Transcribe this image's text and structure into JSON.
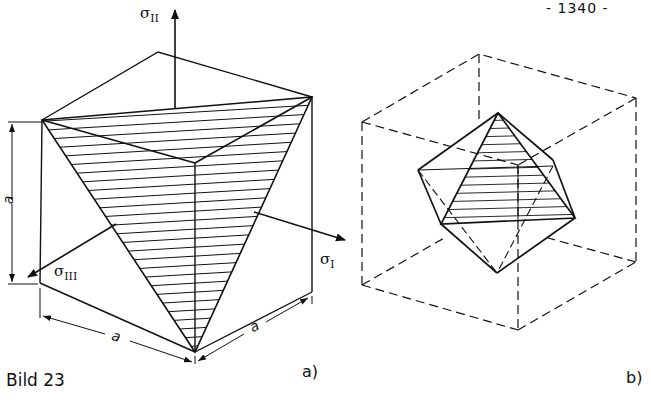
{
  "page_number": "- 1340 -",
  "caption": "Bild 23",
  "figure_a": {
    "label": "a)",
    "axes": {
      "sigma_1": {
        "symbol": "σ",
        "sub": "I"
      },
      "sigma_2": {
        "symbol": "σ",
        "sub": "II"
      },
      "sigma_3": {
        "symbol": "σ",
        "sub": "III"
      }
    },
    "dimensions": {
      "height": "a",
      "width_left": "a",
      "width_right": "a"
    },
    "description": "Cube with inscribed hatched triangular plane and principal stress axes"
  },
  "figure_b": {
    "label": "b)",
    "description": "Dashed cube with inscribed octahedron, one hatched face"
  },
  "colors": {
    "ink": "#111111",
    "background": "#ffffff"
  }
}
